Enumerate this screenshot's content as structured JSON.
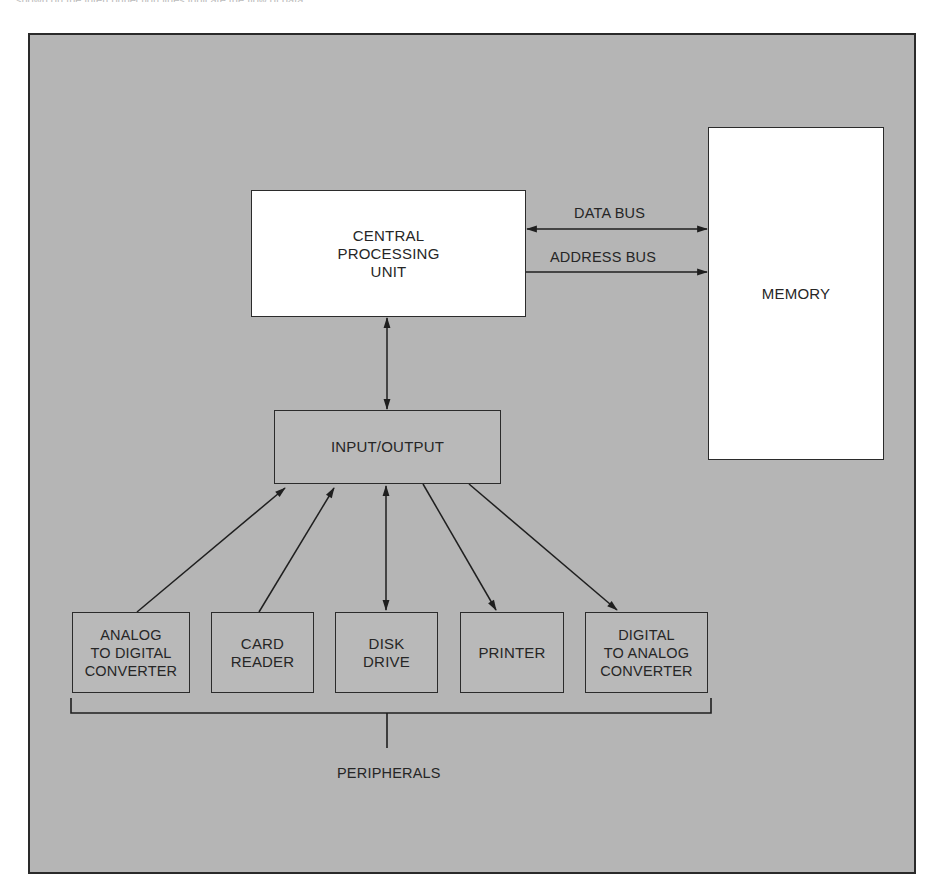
{
  "caption": "shown on the interconnection lines indicate the flow of data.",
  "diagram": {
    "colors": {
      "background": "#b5b5b5",
      "box_white": "#ffffff",
      "box_grey": "#b9b9b9",
      "stroke": "#2b2b2b"
    },
    "nodes": {
      "cpu": {
        "label": "CENTRAL\nPROCESSING\nUNIT"
      },
      "memory": {
        "label": "MEMORY"
      },
      "io": {
        "label": "INPUT/OUTPUT"
      },
      "peripherals": [
        {
          "id": "adc",
          "label": "ANALOG\nTO DIGITAL\nCONVERTER",
          "flow": "to-io"
        },
        {
          "id": "card_reader",
          "label": "CARD\nREADER",
          "flow": "to-io"
        },
        {
          "id": "disk_drive",
          "label": "DISK\nDRIVE",
          "flow": "bidirectional"
        },
        {
          "id": "printer",
          "label": "PRINTER",
          "flow": "from-io"
        },
        {
          "id": "dac",
          "label": "DIGITAL\nTO ANALOG\nCONVERTER",
          "flow": "from-io"
        }
      ]
    },
    "buses": {
      "data_bus": {
        "label": "DATA BUS",
        "flow": "bidirectional"
      },
      "address_bus": {
        "label": "ADDRESS BUS",
        "flow": "cpu-to-memory"
      }
    },
    "cpu_io_link": {
      "flow": "bidirectional"
    },
    "group": {
      "label": "PERIPHERALS"
    }
  }
}
